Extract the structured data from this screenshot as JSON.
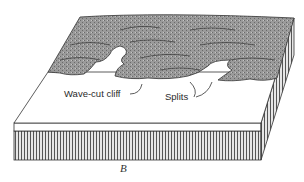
{
  "diagram": {
    "caption": "B",
    "labels": {
      "wave_cut_cliff": "Wave-cut cliff",
      "splits": "Splits"
    },
    "colors": {
      "plateau": "#8f8f8f",
      "plain": "#ffffff",
      "outline": "#333333"
    }
  }
}
